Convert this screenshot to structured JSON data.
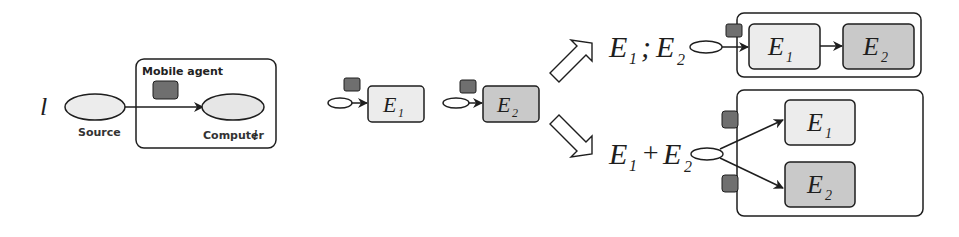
{
  "colors": {
    "stroke": "#1e1e1e",
    "node_fill_light": "#ececec",
    "node_fill_mid": "#c9c9c9",
    "agent_fill": "#6f6f6f",
    "background": "#ffffff"
  },
  "left_panel": {
    "source_symbol": "l",
    "source_label": "Source",
    "agent_label": "Mobile agent",
    "computer_label": "Computer",
    "computer_symbol": "l"
  },
  "middle_panel": {
    "e1": {
      "base": "E",
      "sub": "1"
    },
    "e2": {
      "base": "E",
      "sub": "2"
    }
  },
  "sequential": {
    "expression": {
      "e1": "E",
      "e1_sub": "1",
      "op": ";",
      "e2": "E",
      "e2_sub": "2"
    },
    "box1": {
      "base": "E",
      "sub": "1"
    },
    "box2": {
      "base": "E",
      "sub": "2"
    }
  },
  "parallel": {
    "expression": {
      "e1": "E",
      "e1_sub": "1",
      "op": "+",
      "e2": "E",
      "e2_sub": "2"
    },
    "box1": {
      "base": "E",
      "sub": "1"
    },
    "box2": {
      "base": "E",
      "sub": "2"
    }
  }
}
